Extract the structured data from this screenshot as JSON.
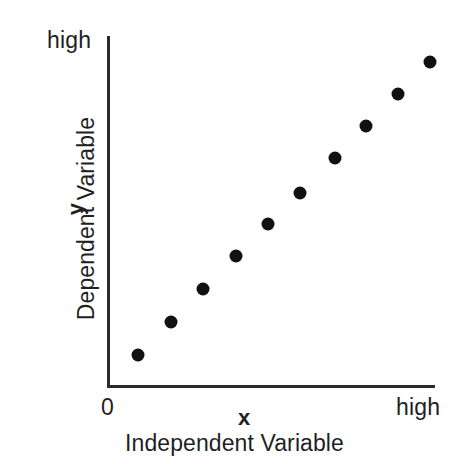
{
  "chart_data": {
    "type": "scatter",
    "title": "",
    "xlabel": "Independent Variable",
    "ylabel": "Dependent Variable",
    "x_symbol": "x",
    "y_symbol": "y",
    "x_tick_labels": [
      "0",
      "high"
    ],
    "y_tick_labels": [
      "high"
    ],
    "xlim": [
      0,
      100
    ],
    "ylim": [
      0,
      100
    ],
    "grid": false,
    "legend": null,
    "annotations": [],
    "series": [
      {
        "name": "observations",
        "marker": "filled-circle",
        "color": "#111111",
        "x": [
          9,
          19,
          29,
          39,
          49,
          58,
          68,
          78,
          88,
          98
        ],
        "y": [
          9,
          18,
          27,
          37,
          46,
          55,
          65,
          74,
          83,
          92
        ],
        "points": [
          {
            "x": 9,
            "y": 9
          },
          {
            "x": 19,
            "y": 18
          },
          {
            "x": 29,
            "y": 27
          },
          {
            "x": 39,
            "y": 37
          },
          {
            "x": 49,
            "y": 46
          },
          {
            "x": 58,
            "y": 55
          },
          {
            "x": 68,
            "y": 65
          },
          {
            "x": 78,
            "y": 74
          },
          {
            "x": 88,
            "y": 83
          },
          {
            "x": 98,
            "y": 92
          }
        ]
      }
    ],
    "pixel_points": [
      {
        "cx": 138,
        "cy": 355
      },
      {
        "cx": 171,
        "cy": 322
      },
      {
        "cx": 203,
        "cy": 289
      },
      {
        "cx": 236,
        "cy": 256
      },
      {
        "cx": 268,
        "cy": 224
      },
      {
        "cx": 300,
        "cy": 193
      },
      {
        "cx": 335,
        "cy": 158
      },
      {
        "cx": 366,
        "cy": 126
      },
      {
        "cx": 398,
        "cy": 94
      },
      {
        "cx": 430,
        "cy": 62
      }
    ]
  },
  "axes": {
    "y_high_label": "high",
    "x_zero_label": "0",
    "x_high_label": "high",
    "x_symbol_label": "x",
    "y_symbol_label": "y",
    "x_title": "Independent Variable",
    "y_title": "Dependent Variable",
    "axis_color": "#2b2b2b"
  },
  "colors": {
    "background": "#ffffff",
    "marker": "#111111",
    "text": "#1f1f1f",
    "axis": "#2b2b2b"
  }
}
